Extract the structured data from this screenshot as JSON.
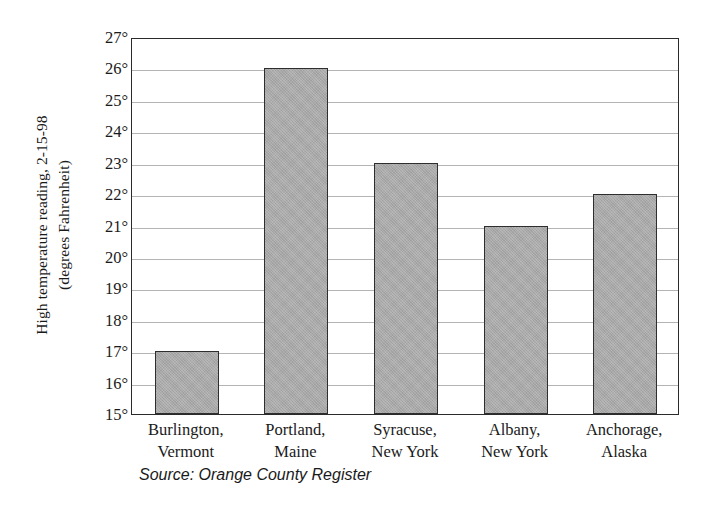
{
  "chart_data": {
    "type": "bar",
    "title": "",
    "xlabel": "",
    "ylabel_line1": "High temperature reading, 2-15-98",
    "ylabel_line2": "(degrees Fahrenheit)",
    "categories": [
      {
        "line1": "Burlington,",
        "line2": "Vermont"
      },
      {
        "line1": "Portland,",
        "line2": "Maine"
      },
      {
        "line1": "Syracuse,",
        "line2": "New York"
      },
      {
        "line1": "Albany,",
        "line2": "New York"
      },
      {
        "line1": "Anchorage,",
        "line2": "Alaska"
      }
    ],
    "values": [
      17,
      26,
      23,
      21,
      22
    ],
    "ylim": [
      15,
      27
    ],
    "ytick_values": [
      27,
      26,
      25,
      24,
      23,
      22,
      21,
      20,
      19,
      18,
      17,
      16,
      15
    ],
    "ytick_labels": [
      "27°",
      "26°",
      "25°",
      "24°",
      "23°",
      "22°",
      "21°",
      "20°",
      "19°",
      "18°",
      "17°",
      "16°",
      "15°"
    ],
    "grid": true,
    "legend": "none",
    "bar_color": "#a9a9a9",
    "bar_border_color": "#2e2e2e",
    "grid_color": "#b4b4b4",
    "frame_color": "#2b2b2b",
    "background": "#ffffff",
    "source_note": "Source: Orange County Register"
  }
}
